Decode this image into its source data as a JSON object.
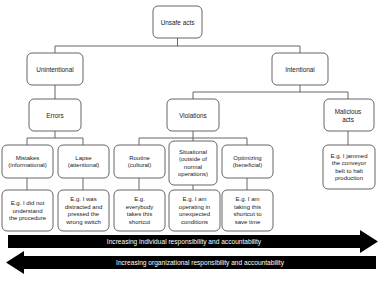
{
  "diagram": {
    "title": "Unsafe acts",
    "root": {
      "id": "unsafe-acts",
      "label": "Unsafe acts"
    },
    "level2": [
      {
        "id": "unintentional",
        "label": "Unintentional"
      },
      {
        "id": "intentional",
        "label": "Intentional"
      }
    ],
    "level3": [
      {
        "id": "errors",
        "label": "Errors"
      },
      {
        "id": "violations",
        "label": "Violations"
      },
      {
        "id": "malicious-acts",
        "label": "Malicious\nacts"
      }
    ],
    "level4": [
      {
        "id": "mistakes",
        "label": "Mistakes\n(informational)"
      },
      {
        "id": "lapse",
        "label": "Lapse\n(attentional)"
      },
      {
        "id": "routine",
        "label": "Routine\n(cultural)"
      },
      {
        "id": "situational",
        "label": "Situational\n(outside of\nnormal\noperations)"
      },
      {
        "id": "optimizing",
        "label": "Optimizing\n(beneficial)"
      },
      {
        "id": "malicious-example",
        "label": "E.g. I jammed\nthe conveyor\nbelt to halt\nproduction"
      }
    ],
    "level5": [
      {
        "id": "mistakes-example",
        "label": "E.g. I did not\nunderstand\nthe procedure"
      },
      {
        "id": "lapse-example",
        "label": "E.g. I was\ndistracted and\npressed the\nwrong switch"
      },
      {
        "id": "routine-example",
        "label": "E.g.\neverybody\ntakes this\nshortcut"
      },
      {
        "id": "situational-example",
        "label": "E.g. I am\noperating in\nunexpected\nconditions"
      },
      {
        "id": "optimizing-example",
        "label": "E.g. I am\ntaking this\nshortcut to\nsave time"
      }
    ],
    "arrows": [
      {
        "id": "individual-responsibility-arrow",
        "label": "Increasing individual responsibility and accountability",
        "direction": "right"
      },
      {
        "id": "organizational-responsibility-arrow",
        "label": "Increasing organizational responsibility and accountability",
        "direction": "left"
      }
    ],
    "colors": {
      "background": "#ffffff",
      "box_stroke": "#555555",
      "box_fill": "#ffffff",
      "text": "#1a1a1a",
      "arrow_fill": "#000000",
      "arrow_text": "#ffffff"
    }
  }
}
